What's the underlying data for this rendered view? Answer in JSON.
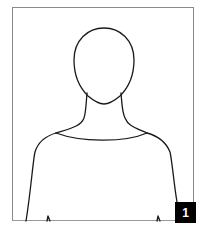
{
  "illustration": {
    "subject": "head-and-shoulders-silhouette",
    "stroke_color": "#1a1a1a",
    "frame_color": "#8a8a8a"
  },
  "badge": {
    "label": "1",
    "background": "#000000",
    "text_color": "#ffffff"
  }
}
